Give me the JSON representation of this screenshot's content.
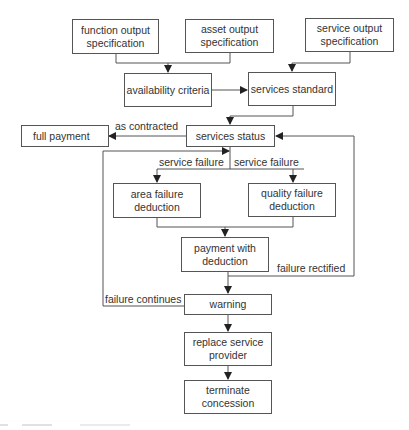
{
  "diagram": {
    "nodes": {
      "function_output": "function output specification",
      "asset_output": "asset output specification",
      "service_output": "service output specification",
      "availability": "availability criteria",
      "services_standard": "services standard",
      "full_payment": "full payment",
      "services_status": "services status",
      "area_failure": "area failure deduction",
      "quality_failure": "quality failure deduction",
      "payment_deduction": "payment with deduction",
      "warning": "warning",
      "replace_provider": "replace service provider",
      "terminate": "terminate concession"
    },
    "edge_labels": {
      "as_contracted": "as contracted",
      "service_failure_left": "service failure",
      "service_failure_right": "service failure",
      "failure_rectified": "failure rectified",
      "failure_continues": "failure continues"
    },
    "colors": {
      "line": "#444444",
      "box_border": "#555555",
      "text": "#333333"
    }
  }
}
